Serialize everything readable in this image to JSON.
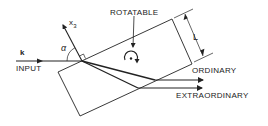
{
  "diagram": {
    "title": "",
    "colors": {
      "line": "#222222",
      "background": "#ffffff"
    },
    "labels": {
      "wave_vector": "k",
      "input": "INPUT",
      "angle": "α",
      "axis": "x",
      "axis_subscript": "3",
      "rotatable": "ROTATABLE",
      "length": "L",
      "ordinary": "ORDINARY",
      "extraordinary": "EXTRAORDINARY"
    },
    "elements": [
      {
        "id": "crystal",
        "type": "tilted-rectangle",
        "label": "ROTATABLE"
      },
      {
        "id": "input-ray",
        "type": "arrow",
        "label": "INPUT",
        "symbol": "k"
      },
      {
        "id": "x3-axis",
        "type": "arrow",
        "label": "x3",
        "note": "normal to crystal face"
      },
      {
        "id": "angle-alpha",
        "type": "angle-arc",
        "label": "α"
      },
      {
        "id": "ordinary-ray",
        "type": "arrow",
        "label": "ORDINARY"
      },
      {
        "id": "extraordinary-ray",
        "type": "arrow",
        "label": "EXTRAORDINARY"
      },
      {
        "id": "thickness",
        "type": "dimension",
        "label": "L"
      },
      {
        "id": "rotation-symbol",
        "type": "rotation-indicator"
      }
    ]
  }
}
